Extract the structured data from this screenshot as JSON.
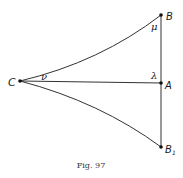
{
  "figure": {
    "caption": "Fig. 97",
    "points": {
      "C": {
        "label": "C",
        "x": 20,
        "y": 81
      },
      "A": {
        "label": "A",
        "x": 161,
        "y": 83
      },
      "B": {
        "label": "B",
        "x": 161,
        "y": 15
      },
      "B1": {
        "label": "B",
        "subscript": "1",
        "x": 161,
        "y": 147
      }
    },
    "angles": {
      "mu": {
        "label": "μ",
        "at": "B"
      },
      "lambda": {
        "label": "λ",
        "at": "A"
      },
      "nu": {
        "label": "ν",
        "at": "C"
      }
    },
    "edges": [
      {
        "from": "C",
        "to": "A",
        "type": "straight"
      },
      {
        "from": "B",
        "to": "B1",
        "type": "straight"
      },
      {
        "from": "C",
        "to": "B",
        "type": "curve"
      },
      {
        "from": "C",
        "to": "B1",
        "type": "curve"
      }
    ],
    "colors": {
      "line": "#333333",
      "point": "#111111",
      "background": "#ffffff"
    }
  }
}
